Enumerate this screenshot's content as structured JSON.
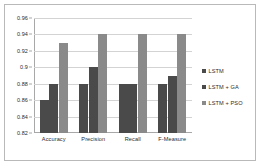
{
  "chart_data": {
    "type": "bar",
    "title": "",
    "xlabel": "",
    "ylabel": "",
    "categories": [
      "Accuracy",
      "Precision",
      "Recall",
      "F-Measure"
    ],
    "series": [
      {
        "name": "LSTM",
        "values": [
          0.86,
          0.88,
          0.88,
          0.88
        ],
        "color": "#4a4a4a"
      },
      {
        "name": "LSTM + GA",
        "values": [
          0.88,
          0.9,
          0.88,
          0.89
        ],
        "color": "#4a4a4a"
      },
      {
        "name": "LSTM + PSO",
        "values": [
          0.93,
          0.94,
          0.94,
          0.94
        ],
        "color": "#8a8a8a"
      }
    ],
    "ylim": [
      0.82,
      0.96
    ],
    "ytick_labels": [
      "0.96",
      "0.94",
      "0.92",
      "0.9",
      "0.88",
      "0.86",
      "0.84",
      "0.82"
    ],
    "ytick_values": [
      0.96,
      0.94,
      0.92,
      0.9,
      0.88,
      0.86,
      0.84,
      0.82
    ],
    "grid": true,
    "legend_position": "right"
  },
  "legend": {
    "entries": [
      {
        "label": "LSTM",
        "marker": "square-swatch-dark"
      },
      {
        "label": "LSTM + GA",
        "marker": "square-swatch-dark"
      },
      {
        "label": "LSTM + PSO",
        "marker": "square-swatch-light"
      }
    ]
  },
  "colors": {
    "series_lstm": "#4a4a4a",
    "series_lstm_ga": "#4a4a4a",
    "series_lstm_pso": "#8a8a8a",
    "gridline": "#d3d3d3",
    "axis": "#a8a8a8",
    "frame_border": "#b9b9b9",
    "plot_background": "#ffffff",
    "text": "#2b2b2b"
  }
}
